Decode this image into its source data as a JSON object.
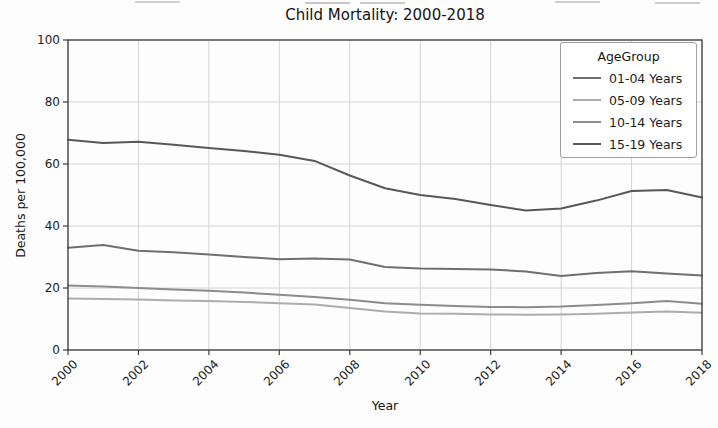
{
  "chart_data": {
    "type": "line",
    "title": "Child Mortality: 2000-2018",
    "xlabel": "Year",
    "ylabel": "Deaths per 100,000",
    "xlim": [
      2000,
      2018
    ],
    "ylim": [
      0,
      100
    ],
    "xticks": [
      2000,
      2002,
      2004,
      2006,
      2008,
      2010,
      2012,
      2014,
      2016,
      2018
    ],
    "yticks": [
      0,
      20,
      40,
      60,
      80,
      100
    ],
    "grid": true,
    "legend": {
      "title": "AgeGroup",
      "position": "upper right"
    },
    "x": [
      2000,
      2001,
      2002,
      2003,
      2004,
      2005,
      2006,
      2007,
      2008,
      2009,
      2010,
      2011,
      2012,
      2013,
      2014,
      2015,
      2016,
      2017,
      2018
    ],
    "series": [
      {
        "name": "01-04 Years",
        "color": "#6f6f6f",
        "values": [
          33.0,
          33.9,
          32.0,
          31.5,
          30.8,
          30.0,
          29.3,
          29.5,
          29.2,
          26.8,
          26.3,
          26.1,
          26.0,
          25.3,
          23.9,
          24.8,
          25.4,
          24.7,
          24.0
        ]
      },
      {
        "name": "05-09 Years",
        "color": "#acacac",
        "values": [
          16.6,
          16.5,
          16.3,
          16.0,
          15.8,
          15.5,
          15.1,
          14.7,
          13.5,
          12.4,
          11.8,
          11.7,
          11.5,
          11.4,
          11.5,
          11.7,
          12.1,
          12.4,
          12.0
        ]
      },
      {
        "name": "10-14 Years",
        "color": "#8c8c8c",
        "values": [
          20.8,
          20.5,
          20.0,
          19.5,
          19.1,
          18.5,
          17.8,
          17.1,
          16.2,
          15.1,
          14.6,
          14.2,
          13.9,
          13.8,
          14.0,
          14.5,
          15.1,
          15.8,
          14.9
        ]
      },
      {
        "name": "15-19 Years",
        "color": "#585858",
        "values": [
          67.8,
          66.8,
          67.2,
          66.2,
          65.2,
          64.2,
          63.0,
          61.0,
          56.3,
          52.2,
          50.0,
          48.7,
          46.8,
          45.0,
          45.6,
          48.2,
          51.3,
          51.6,
          49.2
        ]
      }
    ],
    "style": {
      "grid_color": "#d4d4d4",
      "spine_color": "#3c3c3c",
      "tick_color": "#3c3c3c",
      "background": "#fdfdfd"
    }
  }
}
